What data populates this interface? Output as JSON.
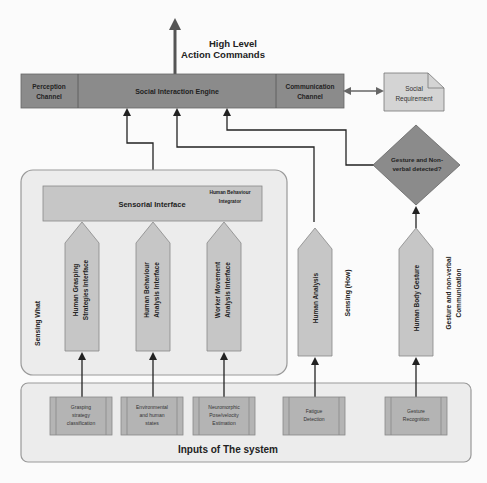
{
  "colors": {
    "background": "#fbfbfb",
    "dark_box": "#8b8b8b",
    "light_box": "#c6c6c6",
    "container": "#ececec",
    "input_box": "#b4b4b4",
    "document": "#d4d4d4",
    "line": "#222222"
  },
  "top": {
    "output_label_line1": "High Level",
    "output_label_line2": "Action Commands"
  },
  "engine_bar": {
    "perception_line1": "Perception",
    "perception_line2": "Channel",
    "engine": "Social Interaction Engine",
    "communication_line1": "Communication",
    "communication_line2": "Channel"
  },
  "social_requirement": {
    "line1": "Social",
    "line2": "Requirement"
  },
  "decision": {
    "line1": "Gesture and Non-",
    "line2": "verbal detected?"
  },
  "sensing_what": {
    "label": "Sensing What",
    "sensorial_interface": "Sensorial Interface",
    "integrator_line1": "Human Behaviour",
    "integrator_line2": "Integrator",
    "interfaces": [
      {
        "line1": "Human Grasping",
        "line2": "Strategies Interface"
      },
      {
        "line1": "Human Behaviour",
        "line2": "Analysis Interface"
      },
      {
        "line1": "Worker Movement",
        "line2": "Analysis Interface"
      }
    ]
  },
  "sensing_how": {
    "human_analysis": "Human Analysis",
    "label": "Sensing (How)"
  },
  "gesture": {
    "human_body_gesture": "Human Body Gesture",
    "label_line1": "Gesture and non-verbal",
    "label_line2": "Communication"
  },
  "inputs": {
    "title": "Inputs of The system",
    "items": [
      {
        "line1": "Grasping",
        "line2": "strategy",
        "line3": "classification"
      },
      {
        "line1": "Environmental",
        "line2": "and human",
        "line3": "states"
      },
      {
        "line1": "Neuromorphic",
        "line2": "Pose/velocity",
        "line3": "Estimation"
      },
      {
        "line1": "Fatigue",
        "line2": "Detection",
        "line3": ""
      },
      {
        "line1": "Gesture",
        "line2": "Recognition",
        "line3": ""
      }
    ]
  }
}
